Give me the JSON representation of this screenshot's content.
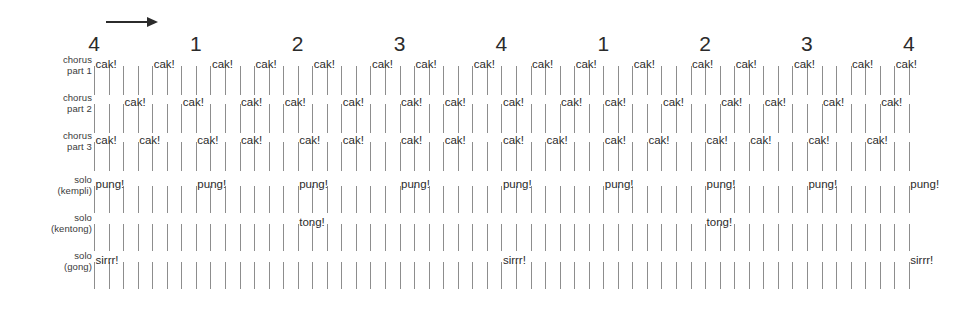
{
  "header": {
    "time_label": "Time",
    "arrow_icon": "right-arrow-icon"
  },
  "beat_numbers": [
    "4",
    "1",
    "2",
    "3",
    "4",
    "1",
    "2",
    "3",
    "4"
  ],
  "rows": [
    {
      "id": "chorus-part-1",
      "label_line1": "chorus",
      "label_line2": "part 1",
      "syllable": "cak!"
    },
    {
      "id": "chorus-part-2",
      "label_line1": "chorus",
      "label_line2": "part 2",
      "syllable": "cak!"
    },
    {
      "id": "chorus-part-3",
      "label_line1": "chorus",
      "label_line2": "part 3",
      "syllable": "cak!"
    },
    {
      "id": "solo-kempli",
      "label_line1": "solo",
      "label_line2": "(kempli)",
      "syllable": "pung!"
    },
    {
      "id": "solo-kentong",
      "label_line1": "solo",
      "label_line2": "(kentong)",
      "syllable": "tong!"
    },
    {
      "id": "solo-gong",
      "label_line1": "solo",
      "label_line2": "(gong)",
      "syllable": "sirrr!"
    }
  ],
  "chart_data": {
    "type": "table",
    "xlabel": "Time",
    "ylabel": "",
    "grid": true,
    "legend": "none",
    "time_axis": {
      "beats": [
        "4",
        "1",
        "2",
        "3",
        "4",
        "1",
        "2",
        "3",
        "4"
      ],
      "subdivisions_per_beat": 7,
      "total_tick_columns": 57,
      "tick_start_x": 94,
      "tick_spacing_px": 14.55
    },
    "series": [
      {
        "name": "chorus part 1",
        "syllable": "cak!",
        "onset_columns": [
          0,
          4,
          8,
          11,
          15,
          19,
          22,
          26,
          30,
          33,
          37,
          41,
          44,
          48,
          52,
          55
        ]
      },
      {
        "name": "chorus part 2",
        "syllable": "cak!",
        "onset_columns": [
          2,
          6,
          10,
          13,
          17,
          21,
          24,
          28,
          32,
          35,
          39,
          43,
          46,
          50,
          54
        ]
      },
      {
        "name": "chorus part 3",
        "syllable": "cak!",
        "onset_columns": [
          0,
          3,
          7,
          10,
          14,
          17,
          21,
          24,
          28,
          31,
          35,
          38,
          42,
          45,
          49,
          53
        ]
      },
      {
        "name": "solo (kempli)",
        "syllable": "pung!",
        "onset_columns": [
          0,
          7,
          14,
          21,
          28,
          35,
          42,
          49,
          56
        ]
      },
      {
        "name": "solo (kentong)",
        "syllable": "tong!",
        "onset_columns": [
          14,
          42
        ]
      },
      {
        "name": "solo (gong)",
        "syllable": "sirrr!",
        "onset_columns": [
          0,
          28,
          56
        ]
      }
    ]
  }
}
